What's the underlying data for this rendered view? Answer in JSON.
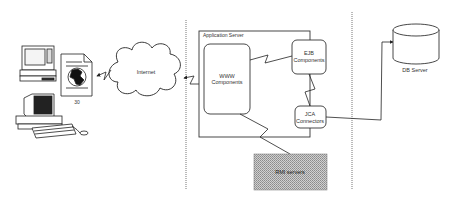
{
  "diagram": {
    "nodes": {
      "laptop": {
        "label": ""
      },
      "desktop": {
        "label": ""
      },
      "document": {
        "label": "30"
      },
      "internet": {
        "label": "Internet"
      },
      "app_server": {
        "label": "Application Server"
      },
      "www": {
        "line1": "WWW",
        "line2": "Components"
      },
      "ejb": {
        "line1": "EJB",
        "line2": "Components"
      },
      "jca": {
        "line1": "JCA",
        "line2": "Connectors"
      },
      "rmi": {
        "label": "RMI servers"
      },
      "db": {
        "label": "DB Server"
      }
    },
    "edges": [
      {
        "from": "internet",
        "to": "document",
        "style": "lightning",
        "arrow": "document"
      },
      {
        "from": "www",
        "to": "internet",
        "style": "lightning",
        "arrow": "internet"
      },
      {
        "from": "www",
        "to": "ejb",
        "style": "lightning"
      },
      {
        "from": "ejb",
        "to": "jca",
        "style": "lightning"
      },
      {
        "from": "www",
        "to": "rmi",
        "style": "lightning"
      },
      {
        "from": "jca",
        "to": "db",
        "style": "elbow",
        "arrow": "db"
      }
    ],
    "colors": {
      "line": "#333333",
      "rmi_fill": "#b8b8b8",
      "boundary": "#777777"
    }
  }
}
